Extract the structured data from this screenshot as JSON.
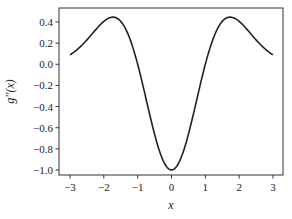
{
  "chart_data": {
    "type": "line",
    "title": "",
    "xlabel": "x",
    "ylabel": "g''(x)",
    "xlim": [
      -3.3,
      3.3
    ],
    "ylim": [
      -1.05,
      0.5
    ],
    "grid": false,
    "legend": null,
    "xticks": [
      -3,
      -2,
      -1,
      0,
      1,
      2,
      3
    ],
    "xtick_labels": [
      "−3",
      "−2",
      "−1",
      "0",
      "1",
      "2",
      "3"
    ],
    "yticks": [
      0.4,
      0.2,
      0.0,
      -0.2,
      -0.4,
      -0.6,
      -0.8,
      -1.0
    ],
    "ytick_labels": [
      "0.4",
      "0.2",
      "0.0",
      "−0.2",
      "−0.4",
      "−0.6",
      "−0.8",
      "−1.0"
    ],
    "series": [
      {
        "name": "g''(x)",
        "color": "#222222",
        "x": [
          -3.0,
          -2.75,
          -2.5,
          -2.25,
          -2.0,
          -1.75,
          -1.5,
          -1.25,
          -1.0,
          -0.75,
          -0.5,
          -0.25,
          0.0,
          0.25,
          0.5,
          0.75,
          1.0,
          1.25,
          1.5,
          1.75,
          2.0,
          2.25,
          2.5,
          2.75,
          3.0
        ],
        "y": [
          0.089,
          0.15,
          0.23,
          0.32,
          0.41,
          0.45,
          0.4,
          0.21,
          0.0,
          -0.33,
          -0.66,
          -0.91,
          -1.0,
          -0.91,
          -0.66,
          -0.33,
          0.0,
          0.21,
          0.4,
          0.45,
          0.41,
          0.32,
          0.23,
          0.15,
          0.089
        ]
      }
    ]
  },
  "colors": {
    "line": "#222222",
    "axis": "#333333",
    "text": "#1a1a1a"
  }
}
